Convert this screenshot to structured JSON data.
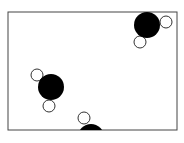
{
  "diagram": {
    "box": {
      "x": 8,
      "y": 12,
      "width": 169,
      "height": 118,
      "stroke": "#444444"
    },
    "oxygen_color": "#000000",
    "hydrogen_color": "#ffffff",
    "molecules": [
      {
        "oxygen": {
          "cx": 147,
          "cy": 25,
          "r": 13
        },
        "hydrogens": [
          {
            "cx": 166,
            "cy": 22,
            "r": 6
          },
          {
            "cx": 140,
            "cy": 42,
            "r": 6
          }
        ]
      },
      {
        "oxygen": {
          "cx": 51,
          "cy": 87,
          "r": 13
        },
        "hydrogens": [
          {
            "cx": 37,
            "cy": 75,
            "r": 6
          },
          {
            "cx": 49,
            "cy": 106,
            "r": 6
          }
        ]
      },
      {
        "oxygen": {
          "cx": 91,
          "cy": 137,
          "r": 13
        },
        "hydrogens": [
          {
            "cx": 84,
            "cy": 118,
            "r": 6
          }
        ]
      }
    ],
    "caption": ""
  }
}
